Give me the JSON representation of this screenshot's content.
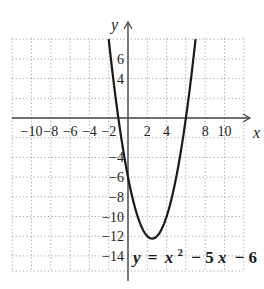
{
  "chart_data": {
    "type": "line",
    "title": "",
    "function": "y = x^2 - 5x - 6",
    "equation_label": {
      "y": "y",
      "eq": "=",
      "x": "x",
      "exp": "2",
      "rest": "− 5",
      "x2": "x",
      "tail": "− 6"
    },
    "xlabel": "x",
    "ylabel": "y",
    "xlim": [
      -12,
      12
    ],
    "ylim": [
      -15.4,
      8
    ],
    "grid": true,
    "grid_style": "dotted",
    "x_ticks": [
      {
        "value": -10,
        "label": "−10"
      },
      {
        "value": -8,
        "label": "−8"
      },
      {
        "value": -6,
        "label": "−6"
      },
      {
        "value": -4,
        "label": "−4"
      },
      {
        "value": -2,
        "label": "−2"
      },
      {
        "value": 2,
        "label": "2"
      },
      {
        "value": 4,
        "label": "4"
      },
      {
        "value": 8,
        "label": "8"
      },
      {
        "value": 10,
        "label": "10"
      }
    ],
    "y_ticks": [
      {
        "value": 6,
        "label": "6"
      },
      {
        "value": 4,
        "label": "4"
      },
      {
        "value": -4,
        "label": "−4"
      },
      {
        "value": -6,
        "label": "−6"
      },
      {
        "value": -8,
        "label": "−8"
      },
      {
        "value": -10,
        "label": "−10"
      },
      {
        "value": -12,
        "label": "−12"
      },
      {
        "value": -14,
        "label": "−14"
      }
    ],
    "series": [
      {
        "name": "y = x^2 - 5x - 6",
        "x": [
          -2,
          -1,
          0,
          1,
          2,
          2.5,
          3,
          4,
          5,
          6,
          7
        ],
        "y": [
          8,
          0,
          -6,
          -10,
          -12,
          -12.25,
          -12,
          -10,
          -6,
          0,
          8
        ]
      }
    ],
    "vertex": [
      2.5,
      -12.25
    ],
    "x_intercepts": [
      -1,
      6
    ],
    "y_intercept": -6
  }
}
